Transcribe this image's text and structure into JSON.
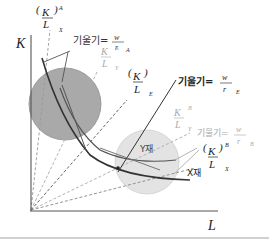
{
  "diagram": {
    "axes": {
      "y_label": "K",
      "x_label": "L"
    },
    "regions": [
      {
        "id": "A",
        "fill": "#a9a9a9"
      },
      {
        "id": "B",
        "fill": "#e2e2e2"
      }
    ],
    "curves": [
      {
        "id": "x-isoquant",
        "label": "X재"
      },
      {
        "id": "y-isoquant",
        "label": "Y재"
      }
    ],
    "labels": {
      "kl_x_A": {
        "num": "K",
        "den": "L",
        "sup": "A",
        "sub": "X"
      },
      "kl_y_A": {
        "num": "K",
        "den": "L",
        "sup": "A",
        "sub": "Y"
      },
      "kl_E": {
        "num": "K",
        "den": "L",
        "sup": "",
        "sub": "E"
      },
      "kl_y_B": {
        "num": "K",
        "den": "L",
        "sup": "B",
        "sub": "Y"
      },
      "kl_x_B": {
        "num": "K",
        "den": "L",
        "sup": "B",
        "sub": "X"
      },
      "slope_A": {
        "prefix": "기울기=",
        "num": "w",
        "den": "r",
        "sub": "A"
      },
      "slope_E": {
        "prefix": "기울기=",
        "num": "w",
        "den": "r",
        "sub": "E"
      },
      "slope_B": {
        "prefix": "기울기=",
        "num": "w",
        "den": "r",
        "sub": "B"
      }
    },
    "colors": {
      "axis": "#555555",
      "curve": "#333333",
      "dashed_dark": "#777777",
      "dashed_light": "#aaaaaa",
      "light_text": "#aaaaaa",
      "dark_text": "#222222"
    }
  }
}
